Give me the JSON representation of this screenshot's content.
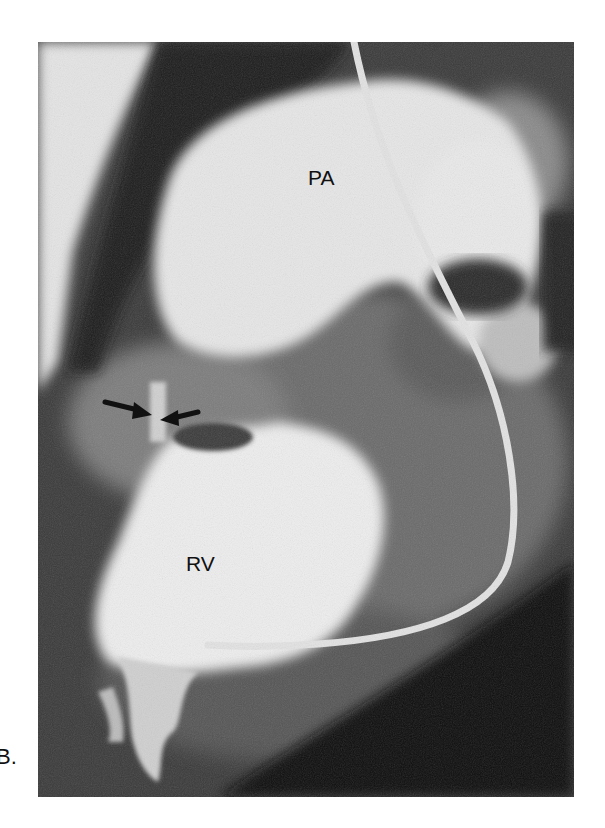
{
  "figure": {
    "panel_label": "B.",
    "annotations": {
      "pa_label": "PA",
      "rv_label": "RV"
    },
    "arrows": [
      {
        "direction": "right",
        "points_to": "valve"
      },
      {
        "direction": "left",
        "points_to": "valve"
      }
    ],
    "colors": {
      "background": "#ffffff",
      "dark_field": "#2a2a2a",
      "contrast_bright": "#ededed",
      "label_text": "#111111"
    }
  }
}
